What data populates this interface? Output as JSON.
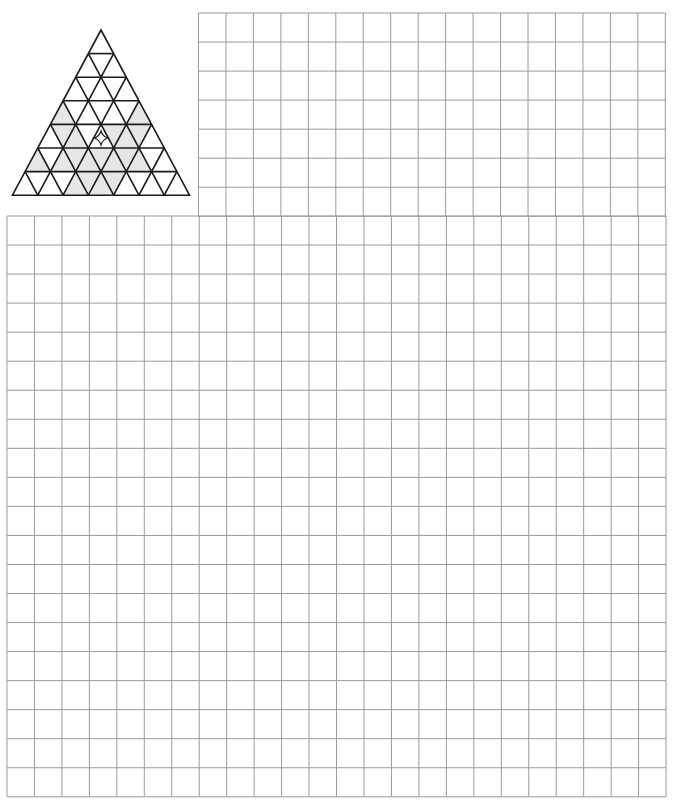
{
  "page": {
    "width": 675,
    "height": 800,
    "background": "#ffffff"
  },
  "colors": {
    "grid_line": "#9a9a9a",
    "triangle_stroke": "#1a1a1a",
    "triangle_fill": "#ffffff",
    "shade_fill": "#e6e6e6",
    "star_stroke": "#1a1a1a"
  },
  "graph_paper": {
    "cell_width": 27.46,
    "cell_height": 29.04,
    "upper_block": {
      "x": 198.5,
      "y": 13,
      "cols": 17,
      "rows": 7
    },
    "lower_block": {
      "x": 7,
      "y": 216,
      "cols": 24,
      "rows": 20
    }
  },
  "triangle_figure": {
    "apex": [
      101,
      30
    ],
    "rows": 7,
    "row_height": 23.6,
    "side": 25.3,
    "shaded": {
      "3": [
        0,
        6
      ],
      "4": [
        1,
        2,
        5,
        6,
        7
      ],
      "5": [
        0,
        2,
        3,
        4,
        5,
        6,
        7,
        8
      ],
      "6": [
        4,
        5,
        6,
        7
      ],
      "7": [
        4,
        5,
        6,
        7,
        8
      ]
    },
    "star_marker": {
      "icon": "four-point-star-icon",
      "x": 101,
      "y": 138,
      "size": 7
    }
  }
}
